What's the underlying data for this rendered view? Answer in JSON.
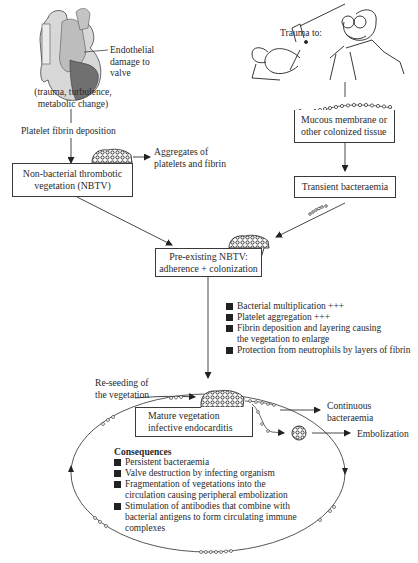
{
  "diagram": {
    "type": "flowchart",
    "topic": "Pathogenesis of infective endocarditis",
    "left_branch": {
      "heart_label": [
        "Endothelial",
        "damage to",
        "valve"
      ],
      "causes": [
        "(trauma, turbulence,",
        "metabolic change)"
      ],
      "step_label": "Platelet fibrin deposition",
      "aggregates_label": [
        "Aggregates of",
        "platelets and fibrin"
      ],
      "nbtv_box": [
        "Non-bacterial thrombotic",
        "vegetation (NBTV)"
      ]
    },
    "right_branch": {
      "trauma_label": "Trauma to:",
      "mucous_box": [
        "Mucous membrane or",
        "other colonized tissue"
      ],
      "bacteraemia_box": "Transient bacteraemia"
    },
    "center": {
      "preexisting_box": [
        "Pre-existing NBTV:",
        "adherence + colonization"
      ],
      "processes": [
        "Bacterial multiplication +++",
        "Platelet aggregation +++",
        "Fibrin deposition and layering causing\nthe vegetation to enlarge",
        "Protection from neutrophils by layers of fibrin"
      ]
    },
    "cycle": {
      "reseeding_label": [
        "Re-seeding of",
        "the vegetation"
      ],
      "mature_box": [
        "Mature vegetation",
        "infective endocarditis"
      ],
      "continuous_label": [
        "Continuous",
        "bacteraemia"
      ],
      "embolization_label": "Embolization",
      "consequences_title": "Consequences",
      "consequences": [
        "Persistent bacteraemia",
        "Valve destruction by infecting organism",
        "Fragmentation of vegetations into the\ncirculation causing peripheral embolization",
        "Stimulation of antibodies that combine with\nbacterial antigens to form circulating immune\ncomplexes"
      ]
    },
    "icons": [
      "heart-illustration",
      "dentist-cartoon",
      "vegetation-icon",
      "bacteria-chain-icon",
      "embolus-icon"
    ]
  }
}
